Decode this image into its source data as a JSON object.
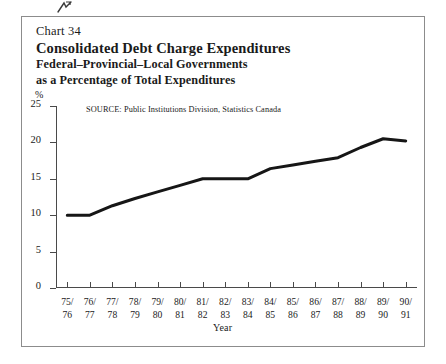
{
  "figure": {
    "chart_number": "Chart 34",
    "title": "Consolidated Debt Charge Expenditures",
    "subtitle_line1": "Federal–Provincial–Local Governments",
    "subtitle_line2": "as a Percentage of Total Expenditures",
    "source": "SOURCE:  Public Institutions Division, Statistics Canada",
    "unit_symbol": "%",
    "axis_name_x": "Year",
    "line_color": "#161616",
    "axis_color": "#4a4a4a",
    "frame_color": "#8c8c8c"
  },
  "chart_data": {
    "type": "line",
    "title": "Consolidated Debt Charge Expenditures",
    "subtitle": "Federal–Provincial–Local Governments as a Percentage of Total Expenditures",
    "xlabel": "Year",
    "ylabel": "%",
    "ylim": [
      0,
      25
    ],
    "yticks": [
      0,
      5,
      10,
      15,
      20,
      25
    ],
    "ytick_labels": [
      "0",
      "5",
      "10",
      "15",
      "20",
      "25"
    ],
    "grid": false,
    "legend": null,
    "categories": [
      "75/\n76",
      "76/\n77",
      "77/\n78",
      "78/\n79",
      "79/\n80",
      "80/\n81",
      "81/\n82",
      "82/\n83",
      "83/\n84",
      "84/\n85",
      "85/\n86",
      "86/\n87",
      "87/\n88",
      "88/\n89",
      "89/\n90",
      "90/\n91"
    ],
    "category_top": [
      "75/",
      "76/",
      "77/",
      "78/",
      "79/",
      "80/",
      "81/",
      "82/",
      "83/",
      "84/",
      "85/",
      "86/",
      "87/",
      "88/",
      "89/",
      "90/"
    ],
    "category_bottom": [
      "76",
      "77",
      "78",
      "79",
      "80",
      "81",
      "82",
      "83",
      "84",
      "85",
      "86",
      "87",
      "88",
      "89",
      "90",
      "91"
    ],
    "values": [
      10.0,
      10.0,
      11.3,
      12.3,
      13.2,
      14.1,
      15.0,
      15.0,
      15.0,
      16.4,
      16.9,
      17.4,
      17.9,
      19.3,
      20.5,
      20.2
    ],
    "annotations": [
      "SOURCE:  Public Institutions Division, Statistics Canada"
    ]
  }
}
